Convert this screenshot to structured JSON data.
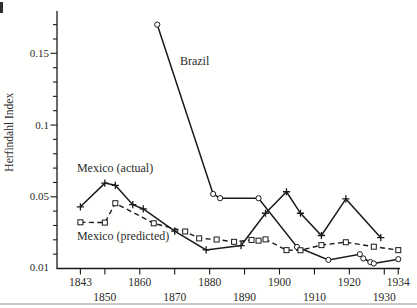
{
  "figure": {
    "ylabel": "Herfindahl Index"
  },
  "chart_data": {
    "type": "line",
    "title": "",
    "xlabel": "",
    "ylabel": "Herfindahl Index",
    "grid": false,
    "legend_position": "inline-annotations",
    "x_axis": {
      "range": [
        1836.3,
        1934.5
      ],
      "ticks_row1": [
        "1843",
        "1860",
        "1880",
        "1900",
        "1920",
        "1934"
      ],
      "ticks_row1_years": [
        1843,
        1860,
        1880,
        1900,
        1920,
        1934
      ],
      "ticks_row2": [
        "1850",
        "1870",
        "1890",
        "1910",
        "1930"
      ],
      "ticks_row2_years": [
        1850,
        1870,
        1890,
        1910,
        1930
      ]
    },
    "y_axis": {
      "range": [
        0,
        0.1795
      ],
      "labeled_ticks": [
        0.01,
        0.05,
        0.1,
        0.15
      ],
      "tick_labels": [
        "0.01",
        "0.05",
        "0.1",
        "0.15"
      ],
      "minor_tick_step": 0.01
    },
    "series": [
      {
        "name": "Brazil",
        "line": "solid",
        "marker": "circle",
        "color": "#1a1a1a",
        "points": [
          [
            1865,
            0.17
          ],
          [
            1881,
            0.052
          ],
          [
            1883,
            0.049
          ],
          [
            1894,
            0.049
          ],
          [
            1905,
            0.015
          ],
          [
            1914,
            0.006
          ],
          [
            1923,
            0.01
          ],
          [
            1924,
            0.007
          ],
          [
            1926,
            0.0045
          ],
          [
            1927,
            0.0035
          ],
          [
            1934,
            0.0065
          ]
        ]
      },
      {
        "name": "Mexico (actual)",
        "line": "solid",
        "marker": "plus",
        "color": "#1a1a1a",
        "points": [
          [
            1843,
            0.043
          ],
          [
            1850,
            0.0595
          ],
          [
            1853,
            0.058
          ],
          [
            1858,
            0.0445
          ],
          [
            1861,
            0.0415
          ],
          [
            1870,
            0.026
          ],
          [
            1879,
            0.013
          ],
          [
            1889,
            0.016
          ],
          [
            1896,
            0.0385
          ],
          [
            1902,
            0.0535
          ],
          [
            1906,
            0.0385
          ],
          [
            1912,
            0.023
          ],
          [
            1919,
            0.0485
          ],
          [
            1929,
            0.0215
          ]
        ]
      },
      {
        "name": "Mexico (predicted)",
        "line": "dashed",
        "marker": "square",
        "color": "#1a1a1a",
        "points": [
          [
            1843,
            0.0322
          ],
          [
            1850,
            0.032
          ],
          [
            1853,
            0.0455
          ],
          [
            1864,
            0.0315
          ],
          [
            1873,
            0.0258
          ],
          [
            1877,
            0.021
          ],
          [
            1882,
            0.0202
          ],
          [
            1887,
            0.0186
          ],
          [
            1892,
            0.0199
          ],
          [
            1894,
            0.0194
          ],
          [
            1896,
            0.0203
          ],
          [
            1902,
            0.0128
          ],
          [
            1906,
            0.0127
          ],
          [
            1912,
            0.0163
          ],
          [
            1919,
            0.0183
          ],
          [
            1927,
            0.0152
          ],
          [
            1934,
            0.0128
          ]
        ]
      }
    ],
    "annotations": [
      {
        "text": "Brazil",
        "year": 1871.5,
        "value": 0.1445,
        "anchor": "start",
        "series": "Brazil"
      },
      {
        "text": "Mexico (actual)",
        "year": 1842,
        "value": 0.07,
        "anchor": "start",
        "series": "Mexico (actual)"
      },
      {
        "text": "Mexico (predicted)",
        "year": 1842,
        "value": 0.023,
        "anchor": "start",
        "series": "Mexico (predicted)"
      }
    ],
    "colors": {
      "ink": "#1a1a1a",
      "text": "#2b2b2b"
    }
  }
}
